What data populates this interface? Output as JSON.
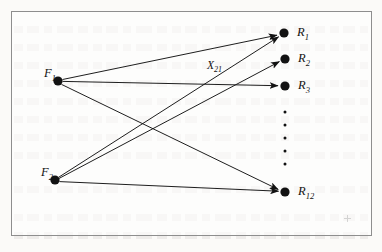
{
  "figure": {
    "kind": "bipartite-graph",
    "border_color": "#8e8e8e",
    "background_color": "#fbfaf8",
    "ink_color": "#121212",
    "width": 382,
    "height": 252
  },
  "source_nodes": [
    {
      "id": "F1",
      "label_main": "F",
      "label_sub": "1",
      "cx": 58,
      "cy": 81,
      "r": 4.6
    },
    {
      "id": "F2",
      "label_main": "F",
      "label_sub": "2",
      "cx": 55,
      "cy": 180,
      "r": 4.6
    }
  ],
  "sink_nodes": [
    {
      "id": "R1",
      "label_main": "R",
      "label_sub": "1",
      "cx": 284,
      "cy": 33,
      "r": 4.6
    },
    {
      "id": "R2",
      "label_main": "R",
      "label_sub": "2",
      "cx": 285,
      "cy": 59,
      "r": 4.6
    },
    {
      "id": "R3",
      "label_main": "R",
      "label_sub": "3",
      "cx": 285,
      "cy": 86,
      "r": 4.6
    },
    {
      "id": "R12",
      "label_main": "R",
      "label_sub": "12",
      "cx": 285,
      "cy": 192,
      "r": 4.6
    }
  ],
  "ellipsis": {
    "name": "vertical-ellipsis",
    "cx": 285,
    "dots_y": [
      112,
      125,
      138,
      151,
      164
    ],
    "dot_r": 1.5
  },
  "edges": [
    {
      "id": "F1-R1",
      "from": "F1",
      "to": "R1",
      "arrowhead": true
    },
    {
      "id": "F1-R3",
      "from": "F1",
      "to": "R3",
      "arrowhead": true
    },
    {
      "id": "F1-R12",
      "from": "F1",
      "to": "R12",
      "arrowhead": true
    },
    {
      "id": "F2-R1",
      "from": "F2",
      "to": "R1",
      "arrowhead": true
    },
    {
      "id": "F2-R2",
      "from": "F2",
      "to": "R2",
      "arrowhead": true
    },
    {
      "id": "F2-R12",
      "from": "F2",
      "to": "R12",
      "arrowhead": true
    }
  ],
  "edge_labels": [
    {
      "id": "X21",
      "for_edge": "F2-R1",
      "label_main": "X",
      "label_sub": "21",
      "x": 207,
      "y": 60
    }
  ]
}
